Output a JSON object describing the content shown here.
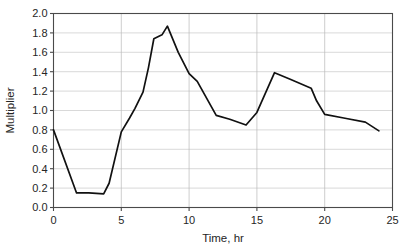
{
  "chart_data": {
    "type": "line",
    "title": "",
    "xlabel": "Time, hr",
    "ylabel": "Multiplier",
    "xlim": [
      0,
      25
    ],
    "ylim": [
      0,
      2.0
    ],
    "xticks": [
      "0",
      "5",
      "10",
      "15",
      "20",
      "25"
    ],
    "xtick_values": [
      0,
      5,
      10,
      15,
      20,
      25
    ],
    "yticks": [
      "0.0",
      "0.2",
      "0.4",
      "0.6",
      "0.8",
      "1.0",
      "1.2",
      "1.4",
      "1.6",
      "1.8",
      "2.0"
    ],
    "ytick_values": [
      0.0,
      0.2,
      0.4,
      0.6,
      0.8,
      1.0,
      1.2,
      1.4,
      1.6,
      1.8,
      2.0
    ],
    "grid": "horizontal-and-vertical",
    "legend": "none",
    "series": [
      {
        "name": "Multiplier",
        "color": "#111111",
        "x": [
          0.0,
          1.7,
          2.6,
          3.7,
          4.1,
          5.0,
          5.6,
          6.0,
          6.6,
          7.0,
          7.4,
          8.0,
          8.4,
          9.2,
          10.0,
          10.6,
          12.0,
          13.0,
          14.2,
          15.0,
          16.3,
          17.5,
          19.0,
          19.4,
          20.0,
          21.5,
          23.0,
          24.0
        ],
        "y": [
          0.8,
          0.15,
          0.15,
          0.14,
          0.25,
          0.78,
          0.92,
          1.02,
          1.19,
          1.44,
          1.74,
          1.78,
          1.87,
          1.6,
          1.38,
          1.3,
          0.95,
          0.91,
          0.85,
          0.98,
          1.39,
          1.32,
          1.23,
          1.1,
          0.96,
          0.92,
          0.88,
          0.79
        ]
      }
    ]
  },
  "axes": {
    "y_title": "Multiplier",
    "x_title": "Time, hr"
  }
}
